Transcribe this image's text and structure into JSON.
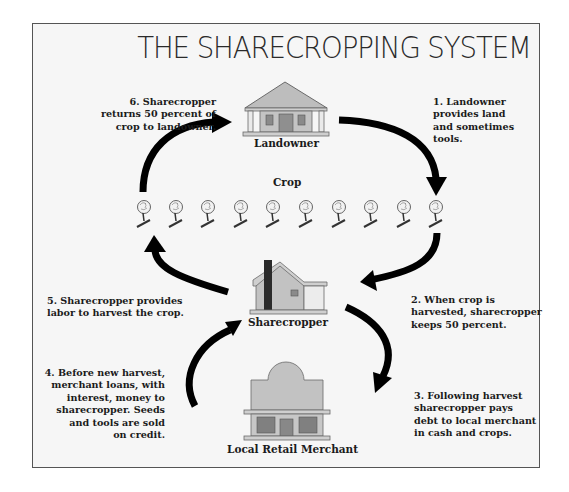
{
  "title": "THE SHARECROPPING SYSTEM",
  "nodes": {
    "landowner": "Landowner",
    "crop": "Crop",
    "sharecropper": "Sharecropper",
    "merchant": "Local Retail Merchant"
  },
  "steps": [
    {
      "num": "1",
      "text": [
        "1. Landowner",
        "provides land",
        "and sometimes",
        "tools."
      ]
    },
    {
      "num": "2",
      "text": [
        "2. When crop is",
        "harvested, sharecropper",
        "keeps 50 percent."
      ]
    },
    {
      "num": "3",
      "text": [
        "3. Following harvest",
        "sharecropper pays",
        "debt to local merchant",
        "in cash and crops."
      ]
    },
    {
      "num": "4",
      "text": [
        "4. Before new harvest,",
        "merchant loans, with",
        "interest, money to",
        "sharecropper. Seeds",
        "and tools are sold",
        "on credit."
      ]
    },
    {
      "num": "5",
      "text": [
        "5. Sharecropper provides",
        "labor to harvest the crop."
      ]
    },
    {
      "num": "6",
      "text": [
        "6. Sharecropper",
        "returns 50 percent of",
        "crop to landowner."
      ]
    }
  ],
  "crop_icons": {
    "count": 10,
    "icon": "cotton-plant-icon"
  },
  "colors": {
    "building_fill": "#b9b9b9",
    "building_dark": "#7d7d7d",
    "chimney": "#2b2b2b",
    "arrow": "#000000",
    "frame_border": "#555555",
    "background": "#f6f6f6"
  }
}
